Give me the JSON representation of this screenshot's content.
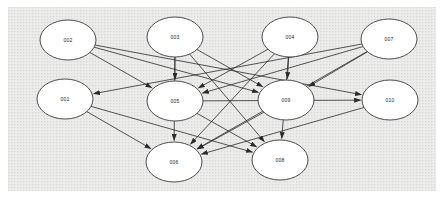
{
  "diagram": {
    "canvas": {
      "background_color": "#ececeb",
      "grid_dot_color": "#d9d9d7",
      "width": 428,
      "height": 184
    },
    "node_style": {
      "fill": "#ffffff",
      "stroke": "#3b3b3b",
      "text_color": "#1a1a1a",
      "rx": 28,
      "ry": 20
    },
    "edge_style": {
      "stroke": "#2b2b2b",
      "arrow_fill": "#2b2b2b"
    },
    "nodes": [
      {
        "id": "002",
        "label": "002",
        "x": 60,
        "y": 33,
        "row": 1,
        "col": 1
      },
      {
        "id": "003",
        "label": "003",
        "x": 167,
        "y": 30,
        "row": 1,
        "col": 2
      },
      {
        "id": "004",
        "label": "004",
        "x": 282,
        "y": 30,
        "row": 1,
        "col": 3
      },
      {
        "id": "007",
        "label": "007",
        "x": 381,
        "y": 32,
        "row": 1,
        "col": 4
      },
      {
        "id": "001",
        "label": "001",
        "x": 57,
        "y": 92,
        "row": 2,
        "col": 1
      },
      {
        "id": "005",
        "label": "005",
        "x": 167,
        "y": 94,
        "row": 2,
        "col": 2
      },
      {
        "id": "009",
        "label": "009",
        "x": 278,
        "y": 93,
        "row": 2,
        "col": 3
      },
      {
        "id": "010",
        "label": "010",
        "x": 382,
        "y": 93,
        "row": 2,
        "col": 4
      },
      {
        "id": "006",
        "label": "006",
        "x": 166,
        "y": 155,
        "row": 3,
        "col": 2
      },
      {
        "id": "008",
        "label": "008",
        "x": 272,
        "y": 153,
        "row": 3,
        "col": 3
      }
    ],
    "edges": [
      {
        "from": "002",
        "to": "005",
        "directed": true
      },
      {
        "from": "002",
        "to": "009",
        "directed": true
      },
      {
        "from": "002",
        "to": "010",
        "directed": true
      },
      {
        "from": "003",
        "to": "005",
        "directed": true
      },
      {
        "from": "003",
        "to": "006",
        "directed": true
      },
      {
        "from": "003",
        "to": "009",
        "directed": true
      },
      {
        "from": "003",
        "to": "008",
        "directed": true
      },
      {
        "from": "004",
        "to": "005",
        "directed": true
      },
      {
        "from": "004",
        "to": "009",
        "directed": true
      },
      {
        "from": "004",
        "to": "006",
        "directed": true
      },
      {
        "from": "004",
        "to": "008",
        "directed": true
      },
      {
        "from": "007",
        "to": "001",
        "directed": true
      },
      {
        "from": "007",
        "to": "005",
        "directed": true
      },
      {
        "from": "007",
        "to": "009",
        "directed": true
      },
      {
        "from": "007",
        "to": "006",
        "directed": true
      },
      {
        "from": "001",
        "to": "006",
        "directed": true
      },
      {
        "from": "001",
        "to": "008",
        "directed": true
      },
      {
        "from": "005",
        "to": "008",
        "directed": true
      },
      {
        "from": "005",
        "to": "010",
        "directed": true
      },
      {
        "from": "009",
        "to": "006",
        "directed": true
      },
      {
        "from": "010",
        "to": "006",
        "directed": true
      }
    ]
  }
}
